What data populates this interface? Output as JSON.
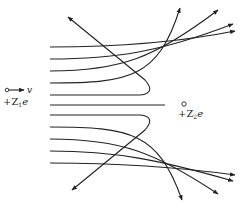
{
  "figure": {
    "projectile": {
      "charge_label": "+Z",
      "charge_sub": "1",
      "charge_suffix": "e",
      "velocity_label": "v"
    },
    "target": {
      "charge_label": "+Z",
      "charge_sub": "2",
      "charge_suffix": "e"
    },
    "caption_partial": "",
    "colors": {
      "line": "#222222",
      "background": "#ffffff"
    },
    "trajectory_count": 11
  }
}
